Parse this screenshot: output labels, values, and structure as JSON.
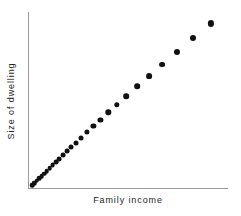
{
  "chart_data": {
    "type": "scatter",
    "title": "",
    "subtitle": "",
    "xlabel": "Family  income",
    "ylabel": "Size  of  dwelling",
    "xlim": [
      0,
      100
    ],
    "ylim": [
      0,
      100
    ],
    "grid": false,
    "legend": null,
    "axis_ticks": {
      "x": [],
      "y": []
    },
    "annotations": [],
    "series": [
      {
        "name": "households",
        "marker": "filled-circle",
        "color": "#111111",
        "description": "Positive, essentially linear relationship; observations are densely packed near the origin and become progressively more widely spaced toward the upper right.",
        "points": [
          {
            "x": 2.0,
            "y": 1.5,
            "r": 2.3
          },
          {
            "x": 3.2,
            "y": 2.8,
            "r": 2.3
          },
          {
            "x": 4.4,
            "y": 4.1,
            "r": 2.3
          },
          {
            "x": 5.6,
            "y": 5.4,
            "r": 2.3
          },
          {
            "x": 6.8,
            "y": 6.8,
            "r": 2.3
          },
          {
            "x": 8.1,
            "y": 8.2,
            "r": 2.3
          },
          {
            "x": 9.4,
            "y": 9.7,
            "r": 2.3
          },
          {
            "x": 10.8,
            "y": 11.2,
            "r": 2.3
          },
          {
            "x": 12.3,
            "y": 12.9,
            "r": 2.4
          },
          {
            "x": 13.9,
            "y": 14.7,
            "r": 2.4
          },
          {
            "x": 15.6,
            "y": 16.6,
            "r": 2.4
          },
          {
            "x": 17.4,
            "y": 18.6,
            "r": 2.4
          },
          {
            "x": 19.4,
            "y": 20.8,
            "r": 2.4
          },
          {
            "x": 21.6,
            "y": 23.2,
            "r": 2.5
          },
          {
            "x": 24.0,
            "y": 25.8,
            "r": 2.5
          },
          {
            "x": 26.6,
            "y": 28.6,
            "r": 2.5
          },
          {
            "x": 29.5,
            "y": 31.7,
            "r": 2.6
          },
          {
            "x": 32.7,
            "y": 35.1,
            "r": 2.6
          },
          {
            "x": 36.2,
            "y": 38.8,
            "r": 2.6
          },
          {
            "x": 40.1,
            "y": 42.9,
            "r": 2.7
          },
          {
            "x": 44.4,
            "y": 47.4,
            "r": 2.7
          },
          {
            "x": 49.2,
            "y": 52.3,
            "r": 2.8
          },
          {
            "x": 54.5,
            "y": 57.7,
            "r": 2.8
          },
          {
            "x": 60.4,
            "y": 63.6,
            "r": 2.9
          },
          {
            "x": 67.0,
            "y": 70.1,
            "r": 2.9
          },
          {
            "x": 74.3,
            "y": 77.2,
            "r": 3.0
          },
          {
            "x": 82.4,
            "y": 85.0,
            "r": 3.0
          },
          {
            "x": 91.4,
            "y": 93.5,
            "r": 3.1
          }
        ]
      }
    ]
  },
  "style": {
    "axis_color": "#9a9a9a",
    "point_color": "#111111",
    "background": "#ffffff",
    "text_color": "#252525"
  }
}
